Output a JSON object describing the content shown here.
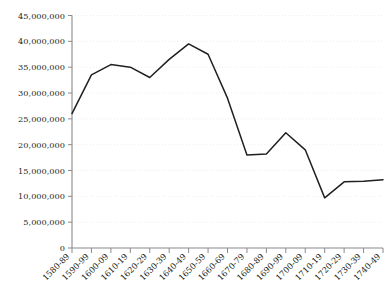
{
  "chart_data": {
    "type": "line",
    "title": "",
    "subtitle": "",
    "xlabel": "",
    "ylabel": "",
    "grid": true,
    "legend": false,
    "categories": [
      "1580-89",
      "1590-99",
      "1600-09",
      "1610-19",
      "1620-29",
      "1630-39",
      "1640-49",
      "1650-59",
      "1660-69",
      "1670-79",
      "1680-89",
      "1690-99",
      "1700-09",
      "1710-19",
      "1720-29",
      "1730-39",
      "1740-49"
    ],
    "values": [
      26000000,
      33500000,
      35500000,
      35000000,
      33000000,
      36500000,
      39500000,
      37500000,
      29000000,
      18000000,
      18200000,
      22300000,
      19000000,
      9700000,
      12800000,
      12900000,
      13200000
    ],
    "ylim": [
      0,
      45000000
    ],
    "ytick_values": [
      0,
      5000000,
      10000000,
      15000000,
      20000000,
      25000000,
      30000000,
      35000000,
      40000000,
      45000000
    ],
    "ytick_labels": [
      "0",
      "5,000,000",
      "10,000,000",
      "15,000,000",
      "20,000,000",
      "25,000,000",
      "30,000,000",
      "35,000,000",
      "40,000,000",
      "45,000,000"
    ],
    "series_color": "#231f20",
    "grid_color": "#e9e9ec",
    "axis_color": "#8a8a8e",
    "text_color": "#231f20"
  }
}
